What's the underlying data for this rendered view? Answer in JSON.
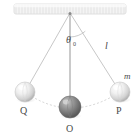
{
  "figure": {
    "background_color": "#ffffff"
  },
  "ceiling": {
    "name": "ceiling-support-bar",
    "x": 14,
    "y": 4,
    "width": 112,
    "height": 10,
    "fill_color": "#f2f2f2",
    "edge_color": "#d8d8d8",
    "hatch_color": "#e2e2e2"
  },
  "pivot": {
    "name": "pivot-point",
    "x": 70,
    "y": 13,
    "color": "#8a8a8a"
  },
  "strings": [
    {
      "name": "string-to-Q",
      "x1": 70,
      "y1": 13,
      "x2": 25,
      "y2": 92,
      "color": "#b9b9b9"
    },
    {
      "name": "string-to-O",
      "x1": 70,
      "y1": 13,
      "x2": 70,
      "y2": 107,
      "color": "#8f8f8f"
    },
    {
      "name": "string-to-P",
      "x1": 70,
      "y1": 13,
      "x2": 120,
      "y2": 92,
      "color": "#b9b9b9"
    }
  ],
  "arc_path": {
    "name": "swing-arc",
    "color": "#c9c9c9",
    "dash": "2,2"
  },
  "angle_arc": {
    "name": "theta-angle-arc",
    "color": "#bdbdbd",
    "radius": 24
  },
  "bobs": [
    {
      "name": "bob-Q",
      "label": "Q",
      "cx": 25,
      "cy": 92,
      "r": 10,
      "fill_light": "#ffffff",
      "fill_mid": "#e6e6e6",
      "fill_dark": "#b2b2b2",
      "label_x": 20,
      "label_y": 114
    },
    {
      "name": "bob-O",
      "label": "O",
      "cx": 70,
      "cy": 107,
      "r": 11,
      "fill_light": "#b6b6b6",
      "fill_mid": "#8d8d8d",
      "fill_dark": "#5e5e5e",
      "label_x": 66,
      "label_y": 132
    },
    {
      "name": "bob-P",
      "label": "P",
      "cx": 120,
      "cy": 92,
      "r": 10,
      "fill_light": "#ffffff",
      "fill_mid": "#e6e6e6",
      "fill_dark": "#b2b2b2",
      "label_x": 116,
      "label_y": 114
    }
  ],
  "labels": {
    "theta": {
      "name": "angle-label-theta-zero",
      "symbol": "θ",
      "subscript": "0",
      "x": 66,
      "y": 43
    },
    "length": {
      "name": "length-label-l",
      "text": "l",
      "x": 105,
      "y": 49
    },
    "mass": {
      "name": "mass-label-m",
      "text": "m",
      "x": 124,
      "y": 79
    }
  }
}
